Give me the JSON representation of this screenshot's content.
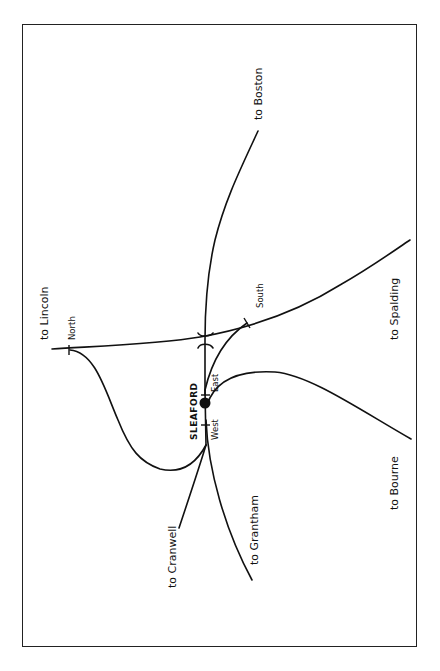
{
  "diagram": {
    "type": "railway junction sketch map",
    "orientation": "rotated 90 degrees (text reads bottom-to-top)",
    "station": {
      "name": "SLEAFORD"
    },
    "junctions": {
      "north": "North",
      "south": "South",
      "east": "East",
      "west": "West"
    },
    "destinations": {
      "boston": "to Boston",
      "lincoln": "to Lincoln",
      "spalding": "to Spalding",
      "bourne": "to Bourne",
      "cranwell": "to Cranwell",
      "grantham": "to Grantham"
    },
    "colors": {
      "line": "#111111",
      "background": "#ffffff",
      "frame": "#222222"
    }
  }
}
